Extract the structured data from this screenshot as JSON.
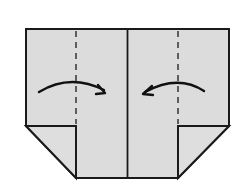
{
  "diagram": {
    "type": "origami-fold-step",
    "colors": {
      "paper": "#dcdcdc",
      "line": "#1a1a1a",
      "background": "#ffffff"
    },
    "elements": [
      {
        "name": "paper-outline",
        "description": "rectangle with bottom corners folded up"
      },
      {
        "name": "center-crease",
        "style": "solid"
      },
      {
        "name": "left-valley-fold-line",
        "style": "dashed"
      },
      {
        "name": "right-valley-fold-line",
        "style": "dashed"
      },
      {
        "name": "left-fold-arrow",
        "direction": "right"
      },
      {
        "name": "right-fold-arrow",
        "direction": "left"
      },
      {
        "name": "left-corner-flap"
      },
      {
        "name": "right-corner-flap"
      }
    ]
  }
}
